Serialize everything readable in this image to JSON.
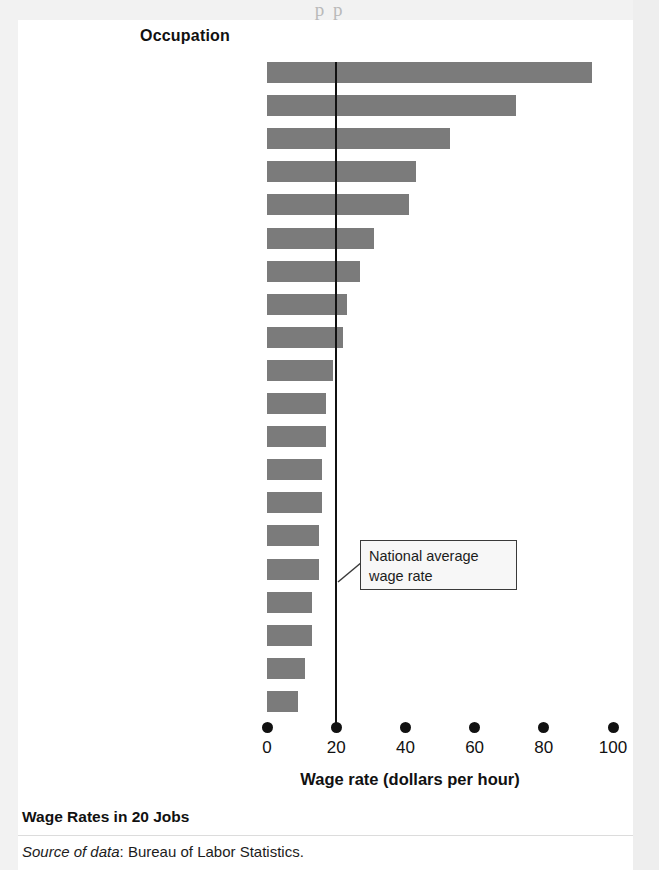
{
  "page": {
    "top_partial_text": "p                                                                    p",
    "background_color": "#f2f2f2"
  },
  "figure": {
    "title": "Wage Rates in 20 Jobs",
    "source_prefix": "Source of data",
    "source_text": ": Bureau of Labor Statistics.",
    "category_header": "Occupation",
    "bar_color": "#7b7b7b",
    "axis_color": "#111111"
  },
  "annotation": {
    "line1": "National average",
    "line2": "wage rate",
    "value": 20
  },
  "chart_data": {
    "type": "bar",
    "orientation": "horizontal",
    "title": "Wage Rates in 20 Jobs",
    "xlabel": "Wage rate (dollars per hour)",
    "ylabel": "Occupation",
    "xlim": [
      0,
      100
    ],
    "xticks": [
      0,
      20,
      40,
      60,
      80,
      100
    ],
    "xtick_labels": [
      "0",
      "20",
      "40",
      "60",
      "80",
      "100"
    ],
    "grid": false,
    "legend": null,
    "reference_line": {
      "value": 20,
      "label": "National average wage rate"
    },
    "categories": [
      "Surgeons",
      "Dentists",
      "Air traffic controllers",
      "Economists",
      "Financial analysts",
      "Technical writers",
      "Real estate sales agents",
      "Computer support specialists",
      "Crane operators",
      "Truck drivers",
      "Travel guides",
      "Fitness trainers",
      "Word processors and typists",
      "Construction laborers",
      "Van drivers",
      "Medical assistants",
      "Retail salespersons",
      "Bank tellers",
      "Motion picture projectionists",
      "Fast-food workers"
    ],
    "values": [
      94,
      72,
      53,
      43,
      41,
      31,
      27,
      23,
      22,
      19,
      17,
      17,
      16,
      16,
      15,
      15,
      13,
      13,
      11,
      9
    ]
  }
}
